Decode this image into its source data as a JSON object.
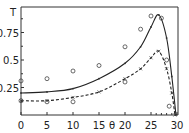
{
  "chart_data": {
    "type": "line",
    "title": "",
    "xlabel": "θ",
    "ylabel": "T",
    "xlim": [
      0,
      30
    ],
    "ylim": [
      0,
      1.0
    ],
    "x_ticks": [
      "0",
      "5",
      "10",
      "15",
      "20",
      "25",
      "30"
    ],
    "y_ticks": [
      "0.25",
      "0.5",
      "0.75"
    ],
    "grid": false,
    "legend": null,
    "series": [
      {
        "name": "solid curve",
        "style": "solid",
        "marker": "dot",
        "x": [
          0,
          5,
          10,
          15,
          20,
          23,
          25,
          26.5,
          28,
          29,
          29.8
        ],
        "y": [
          0.2,
          0.21,
          0.24,
          0.33,
          0.47,
          0.62,
          0.8,
          0.91,
          0.7,
          0.35,
          0
        ]
      },
      {
        "name": "dashed curve",
        "style": "dashed",
        "marker": "cross",
        "x": [
          0,
          5,
          10,
          15,
          20,
          23,
          25,
          26.5,
          28,
          29,
          29.6
        ],
        "y": [
          0.13,
          0.13,
          0.16,
          0.21,
          0.33,
          0.42,
          0.52,
          0.58,
          0.42,
          0.2,
          0
        ]
      },
      {
        "name": "measured (open circles)",
        "style": "scatter",
        "marker": "circle",
        "x": [
          0,
          0,
          5,
          5,
          10,
          10,
          15,
          20,
          20,
          23,
          25,
          27,
          28,
          28.5
        ],
        "y": [
          0.31,
          0.13,
          0.33,
          0.12,
          0.4,
          0.12,
          0.45,
          0.62,
          0.3,
          0.78,
          0.9,
          0.88,
          0.5,
          0.08
        ]
      }
    ]
  },
  "labels": {
    "y_axis_symbol": "T",
    "x_axis_symbol": "θ"
  }
}
